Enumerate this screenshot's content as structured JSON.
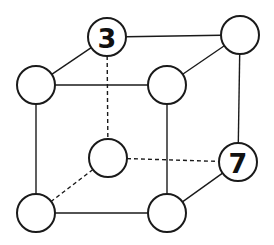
{
  "diagram": {
    "type": "cube-graph",
    "colors": {
      "stroke": "#1a1a1a",
      "fill": "#ffffff",
      "label": "#111111"
    },
    "nodes": [
      {
        "id": "back-top-left",
        "x": 107,
        "y": 37,
        "label": "3"
      },
      {
        "id": "back-top-right",
        "x": 240,
        "y": 35,
        "label": ""
      },
      {
        "id": "front-top-left",
        "x": 36,
        "y": 85,
        "label": ""
      },
      {
        "id": "front-top-right",
        "x": 167,
        "y": 85,
        "label": ""
      },
      {
        "id": "back-bottom-left",
        "x": 108,
        "y": 158,
        "label": ""
      },
      {
        "id": "back-bottom-right",
        "x": 238,
        "y": 162,
        "label": "7"
      },
      {
        "id": "front-bottom-left",
        "x": 36,
        "y": 213,
        "label": ""
      },
      {
        "id": "front-bottom-right",
        "x": 167,
        "y": 213,
        "label": ""
      }
    ],
    "edges": [
      {
        "from": "back-top-left",
        "to": "back-top-right",
        "style": "solid"
      },
      {
        "from": "back-top-left",
        "to": "front-top-left",
        "style": "solid"
      },
      {
        "from": "back-top-right",
        "to": "front-top-right",
        "style": "solid"
      },
      {
        "from": "front-top-left",
        "to": "front-top-right",
        "style": "solid"
      },
      {
        "from": "front-top-left",
        "to": "front-bottom-left",
        "style": "solid"
      },
      {
        "from": "front-top-right",
        "to": "front-bottom-right",
        "style": "solid"
      },
      {
        "from": "back-top-right",
        "to": "back-bottom-right",
        "style": "solid"
      },
      {
        "from": "front-bottom-left",
        "to": "front-bottom-right",
        "style": "solid"
      },
      {
        "from": "front-bottom-right",
        "to": "back-bottom-right",
        "style": "solid"
      },
      {
        "from": "back-top-left",
        "to": "back-bottom-left",
        "style": "dashed"
      },
      {
        "from": "back-bottom-left",
        "to": "back-bottom-right",
        "style": "dashed"
      },
      {
        "from": "back-bottom-left",
        "to": "front-bottom-left",
        "style": "dashed"
      }
    ],
    "radius": 19
  }
}
